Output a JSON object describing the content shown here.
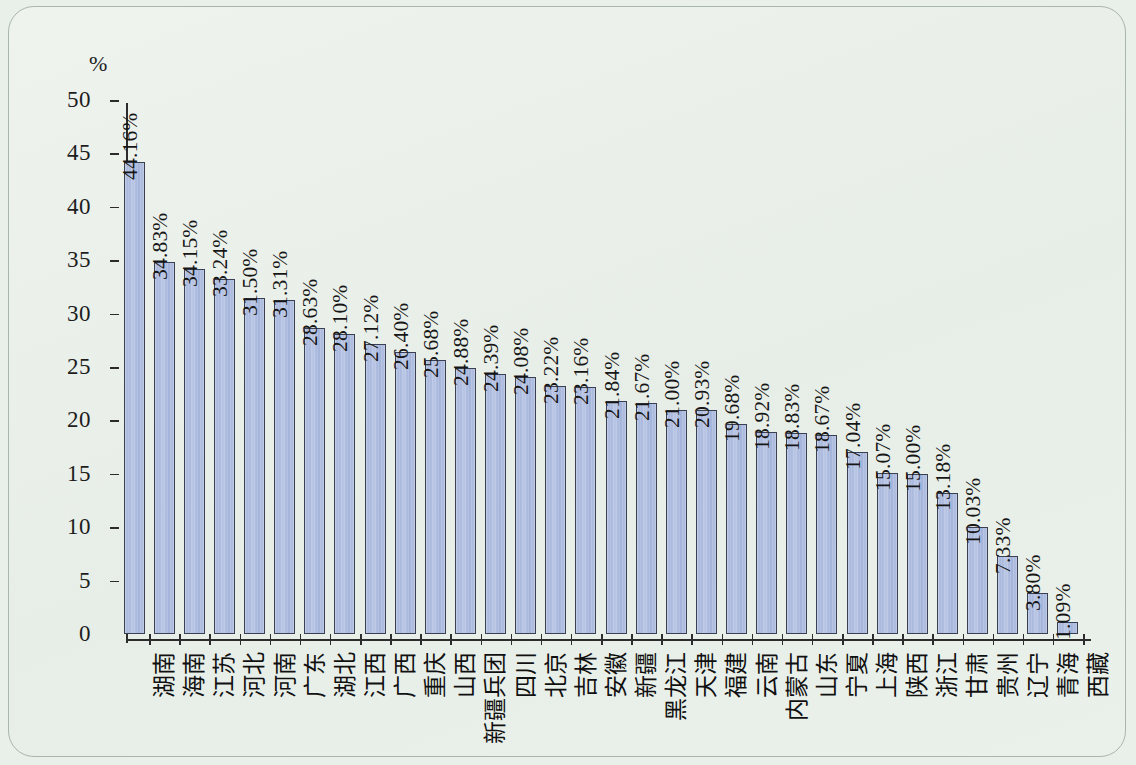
{
  "chart_data": {
    "type": "bar",
    "title": "",
    "subtitle": "",
    "xlabel": "",
    "ylabel": "%",
    "unit_label": "%",
    "ylim": [
      0,
      50
    ],
    "yticks": [
      0,
      5,
      10,
      15,
      20,
      25,
      30,
      35,
      40,
      45,
      50
    ],
    "ytick_labels": [
      "0",
      "5",
      "10",
      "15",
      "20",
      "25",
      "30",
      "35",
      "40",
      "45",
      "50"
    ],
    "grid": false,
    "legend": null,
    "bar_color": "#aab9de",
    "bar_edge_color": "#3a3f52",
    "background_color": "#e9efe9",
    "categories": [
      "湖南",
      "海南",
      "江苏",
      "河北",
      "河南",
      "广东",
      "湖北",
      "江西",
      "广西",
      "重庆",
      "山西",
      "新疆兵团",
      "四川",
      "北京",
      "吉林",
      "安徽",
      "新疆",
      "黑龙江",
      "天津",
      "福建",
      "云南",
      "内蒙古",
      "山东",
      "宁夏",
      "上海",
      "陕西",
      "浙江",
      "甘肃",
      "贵州",
      "辽宁",
      "青海",
      "西藏"
    ],
    "values": [
      44.16,
      34.83,
      34.15,
      33.24,
      31.5,
      31.31,
      28.63,
      28.1,
      27.12,
      26.4,
      25.68,
      24.88,
      24.39,
      24.08,
      23.22,
      23.16,
      21.84,
      21.67,
      21.0,
      20.93,
      19.68,
      18.92,
      18.83,
      18.67,
      17.04,
      15.07,
      15.0,
      13.18,
      10.03,
      7.33,
      3.8,
      1.09
    ],
    "data_labels": [
      "44.16%",
      "34.83%",
      "34.15%",
      "33.24%",
      "31.50%",
      "31.31%",
      "28.63%",
      "28.10%",
      "27.12%",
      "26.40%",
      "25.68%",
      "24.88%",
      "24.39%",
      "24.08%",
      "23.22%",
      "23.16%",
      "21.84%",
      "21.67%",
      "21.00%",
      "20.93%",
      "19.68%",
      "18.92%",
      "18.83%",
      "18.67%",
      "17.04%",
      "15.07%",
      "15.00%",
      "13.18%",
      "10.03%",
      "7.33%",
      "3.80%",
      "1.09%"
    ]
  }
}
